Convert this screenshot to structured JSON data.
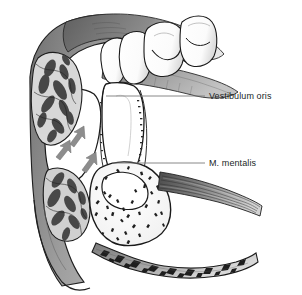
{
  "figure": {
    "domain": "anatomical-illustration",
    "style": "grayscale line and tone drawing",
    "border_color": "#c9c9c9",
    "background_color": "#ffffff"
  },
  "labels": [
    {
      "id": "vestibulum-oris",
      "text": "Vestibulum oris",
      "leader_from_x": 106,
      "leader_to_x": 205,
      "leader_y": 96
    },
    {
      "id": "m-mentalis",
      "text": "M. mentalis",
      "leader_from_x": 112,
      "leader_to_x": 205,
      "leader_y": 163
    }
  ],
  "structures": [
    {
      "id": "tooth-crown-incisor-1",
      "name": "incisor crown",
      "fill": "#ffffff"
    },
    {
      "id": "tooth-crown-incisor-2",
      "name": "incisor crown",
      "fill": "#ffffff"
    },
    {
      "id": "tooth-crown-premolar",
      "name": "premolar crown",
      "fill": "#ffffff"
    },
    {
      "id": "tooth-crown-molar",
      "name": "molar crown",
      "fill": "#ffffff"
    },
    {
      "id": "tooth-root",
      "name": "tooth root in alveolus",
      "fill": "#ffffff"
    },
    {
      "id": "gingiva",
      "name": "gingiva and oral mucosa",
      "fill": "#8e8e8e"
    },
    {
      "id": "vestibule-space",
      "name": "vestibulum oris cavity",
      "fill": "#ffffff"
    },
    {
      "id": "mandible-body",
      "name": "mandibular body with spongy bone",
      "fill": "#fcfcfc"
    },
    {
      "id": "trabecular-bone-lip",
      "name": "trabecular bone of alveolar crest",
      "fill": "#b5b5b5"
    },
    {
      "id": "mentalis-muscle",
      "name": "M. mentalis muscle fibers",
      "fill": "#6e6e6e"
    },
    {
      "id": "lower-lip",
      "name": "lower lip with orbicularis oris fibers",
      "fill": "#9a9a9a"
    },
    {
      "id": "flow-arrow-1",
      "name": "direction arrow",
      "fill": "#8a8a8a"
    },
    {
      "id": "flow-arrow-2",
      "name": "direction arrow",
      "fill": "#8a8a8a"
    },
    {
      "id": "flow-arrow-3",
      "name": "direction arrow",
      "fill": "#8a8a8a"
    }
  ],
  "palette": {
    "ink": "#1a1a1a",
    "tissue_gray": "#8e8e8e",
    "tissue_gray_light": "#b8b8b8",
    "tissue_gray_dark": "#5e5e5e",
    "bone_white": "#ffffff",
    "leader_line": "#7a7a7a",
    "text": "#211f1f"
  }
}
